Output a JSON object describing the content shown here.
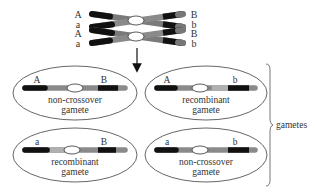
{
  "diagram": {
    "parent": {
      "left_labels": [
        "A",
        "a",
        "A",
        "a"
      ],
      "right_labels": [
        "B",
        "b",
        "B",
        "b"
      ]
    },
    "gametes": [
      {
        "left_allele": "A",
        "right_allele": "B",
        "type_line1": "non-crossover",
        "type_line2": "gamete"
      },
      {
        "left_allele": "A",
        "right_allele": "b",
        "type_line1": "recombinant",
        "type_line2": "gamete"
      },
      {
        "left_allele": "a",
        "right_allele": "B",
        "type_line1": "recombinant",
        "type_line2": "gamete"
      },
      {
        "left_allele": "a",
        "right_allele": "b",
        "type_line1": "non-crossover",
        "type_line2": "gamete"
      }
    ],
    "brace_label": "gametes"
  },
  "colors": {
    "dark_band": "#111111",
    "mid_gray": "#7a7a7a",
    "light_gray": "#a8a8a8",
    "outline": "#555555",
    "text": "#333333"
  }
}
